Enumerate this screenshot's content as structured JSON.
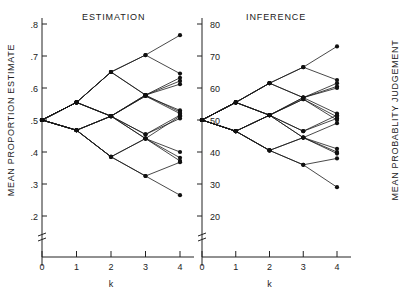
{
  "figure": {
    "panels": [
      {
        "id": "estimation",
        "title": "ESTIMATION"
      },
      {
        "id": "inference",
        "title": "INFERENCE"
      }
    ],
    "xlabel": "k",
    "left_axis_title": "MEAN PROPORTION ESTIMATE",
    "right_axis_title": "MEAN PROBABLITY JUDGEMENT"
  },
  "chart_data": {
    "type": "line",
    "title": "",
    "xlabel": "k",
    "panels": [
      {
        "name": "ESTIMATION",
        "ylabel": "MEAN PROPORTION ESTIMATE",
        "ylim": [
          0.2,
          0.8
        ],
        "yticks": [
          ".2",
          ".3",
          ".4",
          ".5",
          ".6",
          ".7",
          ".8"
        ],
        "ytick_values": [
          0.2,
          0.3,
          0.4,
          0.5,
          0.6,
          0.7,
          0.8
        ],
        "x": [
          0,
          1,
          2,
          3,
          4
        ],
        "xticks": [
          "0",
          "1",
          "2",
          "3",
          "4"
        ],
        "grid": false,
        "legend": "none",
        "series": [
          {
            "name": "SSSS",
            "x": [
              0,
              1,
              2,
              3,
              4
            ],
            "values": [
              0.5,
              0.555,
              0.65,
              0.703,
              0.765
            ]
          },
          {
            "name": "SSSF",
            "x": [
              0,
              1,
              2,
              3,
              4
            ],
            "values": [
              0.5,
              0.555,
              0.65,
              0.703,
              0.645
            ]
          },
          {
            "name": "SSFS",
            "x": [
              0,
              1,
              2,
              3,
              4
            ],
            "values": [
              0.5,
              0.555,
              0.65,
              0.578,
              0.632
            ]
          },
          {
            "name": "SSFF",
            "x": [
              0,
              1,
              2,
              3,
              4
            ],
            "values": [
              0.5,
              0.555,
              0.65,
              0.578,
              0.622
            ]
          },
          {
            "name": "SFSS",
            "x": [
              0,
              1,
              2,
              3,
              4
            ],
            "values": [
              0.5,
              0.555,
              0.512,
              0.578,
              0.612
            ]
          },
          {
            "name": "SFSF",
            "x": [
              0,
              1,
              2,
              3,
              4
            ],
            "values": [
              0.5,
              0.555,
              0.512,
              0.578,
              0.525
            ]
          },
          {
            "name": "SFFS",
            "x": [
              0,
              1,
              2,
              3,
              4
            ],
            "values": [
              0.5,
              0.555,
              0.512,
              0.455,
              0.515
            ]
          },
          {
            "name": "SFFF",
            "x": [
              0,
              1,
              2,
              3,
              4
            ],
            "values": [
              0.5,
              0.555,
              0.512,
              0.455,
              0.505
            ]
          },
          {
            "name": "FSSS",
            "x": [
              0,
              1,
              2,
              3,
              4
            ],
            "values": [
              0.5,
              0.468,
              0.512,
              0.575,
              0.53
            ]
          },
          {
            "name": "FSSF",
            "x": [
              0,
              1,
              2,
              3,
              4
            ],
            "values": [
              0.5,
              0.468,
              0.512,
              0.575,
              0.52
            ]
          },
          {
            "name": "FSFS",
            "x": [
              0,
              1,
              2,
              3,
              4
            ],
            "values": [
              0.5,
              0.468,
              0.512,
              0.442,
              0.512
            ]
          },
          {
            "name": "FSFF",
            "x": [
              0,
              1,
              2,
              3,
              4
            ],
            "values": [
              0.5,
              0.468,
              0.512,
              0.442,
              0.4
            ]
          },
          {
            "name": "FFSS",
            "x": [
              0,
              1,
              2,
              3,
              4
            ],
            "values": [
              0.5,
              0.468,
              0.385,
              0.442,
              0.382
            ]
          },
          {
            "name": "FFSF",
            "x": [
              0,
              1,
              2,
              3,
              4
            ],
            "values": [
              0.5,
              0.468,
              0.385,
              0.442,
              0.372
            ]
          },
          {
            "name": "FFFS",
            "x": [
              0,
              1,
              2,
              3,
              4
            ],
            "values": [
              0.5,
              0.468,
              0.385,
              0.325,
              0.368
            ]
          },
          {
            "name": "FFFF",
            "x": [
              0,
              1,
              2,
              3,
              4
            ],
            "values": [
              0.5,
              0.468,
              0.385,
              0.325,
              0.265
            ]
          }
        ]
      },
      {
        "name": "INFERENCE",
        "ylabel": "MEAN PROBABLITY JUDGEMENT",
        "ylim": [
          20,
          80
        ],
        "yticks": [
          "20",
          "30",
          "40",
          "50",
          "60",
          "70",
          "80"
        ],
        "ytick_values": [
          20,
          30,
          40,
          50,
          60,
          70,
          80
        ],
        "x": [
          0,
          1,
          2,
          3,
          4
        ],
        "xticks": [
          "0",
          "1",
          "2",
          "3",
          "4"
        ],
        "grid": false,
        "legend": "none",
        "series": [
          {
            "name": "SSSS",
            "x": [
              0,
              1,
              2,
              3,
              4
            ],
            "values": [
              50.0,
              55.5,
              61.5,
              66.5,
              73.0
            ]
          },
          {
            "name": "SSSF",
            "x": [
              0,
              1,
              2,
              3,
              4
            ],
            "values": [
              50.0,
              55.5,
              61.5,
              66.5,
              62.5
            ]
          },
          {
            "name": "SSFS",
            "x": [
              0,
              1,
              2,
              3,
              4
            ],
            "values": [
              50.0,
              55.5,
              61.5,
              57.0,
              61.5
            ]
          },
          {
            "name": "SSFF",
            "x": [
              0,
              1,
              2,
              3,
              4
            ],
            "values": [
              50.0,
              55.5,
              61.5,
              57.0,
              60.5
            ]
          },
          {
            "name": "SFSS",
            "x": [
              0,
              1,
              2,
              3,
              4
            ],
            "values": [
              50.0,
              55.5,
              51.5,
              57.0,
              60.0
            ]
          },
          {
            "name": "SFSF",
            "x": [
              0,
              1,
              2,
              3,
              4
            ],
            "values": [
              50.0,
              55.5,
              51.5,
              57.0,
              52.0
            ]
          },
          {
            "name": "SFFS",
            "x": [
              0,
              1,
              2,
              3,
              4
            ],
            "values": [
              50.0,
              55.5,
              51.5,
              46.5,
              51.5
            ]
          },
          {
            "name": "SFFF",
            "x": [
              0,
              1,
              2,
              3,
              4
            ],
            "values": [
              50.0,
              55.5,
              51.5,
              46.5,
              50.5
            ]
          },
          {
            "name": "FSSS",
            "x": [
              0,
              1,
              2,
              3,
              4
            ],
            "values": [
              50.0,
              46.5,
              51.5,
              56.5,
              51.0
            ]
          },
          {
            "name": "FSSF",
            "x": [
              0,
              1,
              2,
              3,
              4
            ],
            "values": [
              50.0,
              46.5,
              51.5,
              56.5,
              50.0
            ]
          },
          {
            "name": "FSFS",
            "x": [
              0,
              1,
              2,
              3,
              4
            ],
            "values": [
              50.0,
              46.5,
              51.5,
              44.5,
              49.0
            ]
          },
          {
            "name": "FSFF",
            "x": [
              0,
              1,
              2,
              3,
              4
            ],
            "values": [
              50.0,
              46.5,
              51.5,
              44.5,
              41.0
            ]
          },
          {
            "name": "FFSS",
            "x": [
              0,
              1,
              2,
              3,
              4
            ],
            "values": [
              50.0,
              46.5,
              40.5,
              44.5,
              40.0
            ]
          },
          {
            "name": "FFSF",
            "x": [
              0,
              1,
              2,
              3,
              4
            ],
            "values": [
              50.0,
              46.5,
              40.5,
              44.5,
              39.5
            ]
          },
          {
            "name": "FFFS",
            "x": [
              0,
              1,
              2,
              3,
              4
            ],
            "values": [
              50.0,
              46.5,
              40.5,
              36.0,
              38.0
            ]
          },
          {
            "name": "FFFF",
            "x": [
              0,
              1,
              2,
              3,
              4
            ],
            "values": [
              50.0,
              46.5,
              40.5,
              36.0,
              29.0
            ]
          }
        ]
      }
    ]
  }
}
